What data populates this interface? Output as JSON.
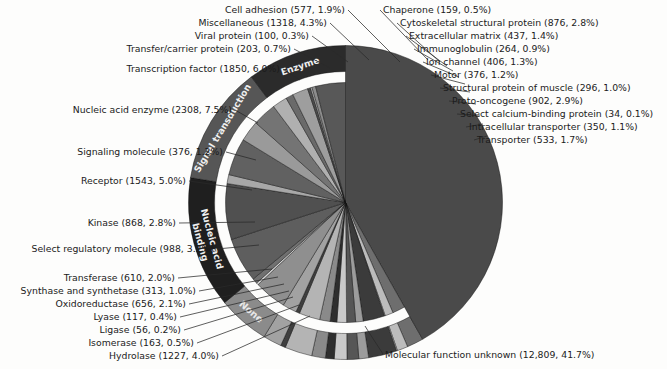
{
  "chart_data": {
    "type": "pie",
    "title": "",
    "subtitle": "",
    "xlabel": "",
    "ylabel": "",
    "legend_position": "none",
    "grid": false,
    "total_count": 30728,
    "value_unit": "proteins",
    "label_format": "name (count, percent)",
    "rings": [
      "inner: individual molecular function categories",
      "outer: grouped super-categories"
    ],
    "categories": [
      "Molecular function unknown",
      "Nucleic acid enzyme",
      "Transcription factor",
      "Transfer/carrier protein",
      "Viral protein",
      "Miscellaneous",
      "Cell adhesion",
      "Chaperone",
      "Cytoskeletal structural protein",
      "Extracellular matrix",
      "Immunoglobulin",
      "Ion channel",
      "Motor",
      "Structural protein of muscle",
      "Proto-oncogene",
      "Select calcium-binding protein",
      "Intracellular transporter",
      "Transporter",
      "Signaling molecule",
      "Receptor",
      "Kinase",
      "Select regulatory molecule",
      "Transferase",
      "Synthase and synthetase",
      "Oxidoreductase",
      "Lyase",
      "Ligase",
      "Isomerase",
      "Hydrolase"
    ],
    "values": [
      12809,
      2308,
      1850,
      203,
      100,
      1318,
      577,
      159,
      876,
      437,
      264,
      406,
      376,
      296,
      902,
      34,
      350,
      533,
      376,
      1543,
      868,
      988,
      610,
      313,
      656,
      117,
      56,
      163,
      1227
    ],
    "percents": [
      41.7,
      7.5,
      6.0,
      0.7,
      0.3,
      4.3,
      1.9,
      0.5,
      2.8,
      1.4,
      0.9,
      1.3,
      1.2,
      1.0,
      2.9,
      0.1,
      1.1,
      1.7,
      1.2,
      5.0,
      2.8,
      3.2,
      2.0,
      1.0,
      2.1,
      0.4,
      0.2,
      0.5,
      4.0
    ]
  },
  "slices": [
    {
      "name": "Molecular function unknown",
      "count": "12,809",
      "percent": "41.7%",
      "label": "Molecular function unknown (12,809, 41.7%)",
      "value": 41.7,
      "shade": "#4a4a4a",
      "group": "none",
      "full_radius": true
    },
    {
      "name": "Transporter",
      "count": "533",
      "percent": "1.7%",
      "label": "Transporter (533, 1.7%)",
      "value": 1.7,
      "shade": "#6e6e6e",
      "group": "ungrouped"
    },
    {
      "name": "Intracellular transporter",
      "count": "350",
      "percent": "1.1%",
      "label": "Intracellular transporter (350, 1.1%)",
      "value": 1.1,
      "shade": "#bcbcbc",
      "group": "ungrouped"
    },
    {
      "name": "Select calcium-binding protein",
      "count": "34",
      "percent": "0.1%",
      "label": "Select calcium-binding protein (34, 0.1%)",
      "value": 0.1,
      "shade": "#d6d6d6",
      "group": "ungrouped"
    },
    {
      "name": "Proto-oncogene",
      "count": "902",
      "percent": "2.9%",
      "label": "Proto-oncogene (902, 2.9%)",
      "value": 2.9,
      "shade": "#3b3b3b",
      "group": "ungrouped"
    },
    {
      "name": "Structural protein of muscle",
      "count": "296",
      "percent": "1.0%",
      "label": "Structural protein of muscle (296, 1.0%)",
      "value": 1.0,
      "shade": "#9c9c9c",
      "group": "ungrouped"
    },
    {
      "name": "Motor",
      "count": "376",
      "percent": "1.2%",
      "label": "Motor (376, 1.2%)",
      "value": 1.2,
      "shade": "#565656",
      "group": "ungrouped"
    },
    {
      "name": "Ion channel",
      "count": "406",
      "percent": "1.3%",
      "label": "Ion channel (406, 1.3%)",
      "value": 1.3,
      "shade": "#c9c9c9",
      "group": "ungrouped"
    },
    {
      "name": "Immunoglobulin",
      "count": "264",
      "percent": "0.9%",
      "label": "Immunoglobulin (264, 0.9%)",
      "value": 0.9,
      "shade": "#2e2e2e",
      "group": "ungrouped"
    },
    {
      "name": "Extracellular matrix",
      "count": "437",
      "percent": "1.4%",
      "label": "Extracellular matrix (437, 1.4%)",
      "value": 1.4,
      "shade": "#8a8a8a",
      "group": "ungrouped"
    },
    {
      "name": "Cytoskeletal structural protein",
      "count": "876",
      "percent": "2.8%",
      "label": "Cytoskeletal structural protein (876, 2.8%)",
      "value": 2.8,
      "shade": "#b4b4b4",
      "group": "ungrouped"
    },
    {
      "name": "Chaperone",
      "count": "159",
      "percent": "0.5%",
      "label": "Chaperone (159, 0.5%)",
      "value": 0.5,
      "shade": "#3f3f3f",
      "group": "ungrouped"
    },
    {
      "name": "Cell adhesion",
      "count": "577",
      "percent": "1.9%",
      "label": "Cell adhesion (577, 1.9%)",
      "value": 1.9,
      "shade": "#a2a2a2",
      "group": "ungrouped"
    },
    {
      "name": "Miscellaneous",
      "count": "1318",
      "percent": "4.3%",
      "label": "Miscellaneous (1318, 4.3%)",
      "value": 4.3,
      "shade": "#8f8f8f",
      "group": "none-group"
    },
    {
      "name": "Viral protein",
      "count": "100",
      "percent": "0.3%",
      "label": "Viral protein (100, 0.3%)",
      "value": 0.3,
      "shade": "#d2d2d2",
      "group": "none-group"
    },
    {
      "name": "Transfer/carrier protein",
      "count": "203",
      "percent": "0.7%",
      "label": "Transfer/carrier protein (203, 0.7%)",
      "value": 0.7,
      "shade": "#707070",
      "group": "none-group"
    },
    {
      "name": "Transcription factor",
      "count": "1850",
      "percent": "6.0%",
      "label": "Transcription factor (1850, 6.0%)",
      "value": 6.0,
      "shade": "#5e5e5e",
      "group": "nucleic"
    },
    {
      "name": "Nucleic acid enzyme",
      "count": "2308",
      "percent": "7.5%",
      "label": "Nucleic acid enzyme (2308, 7.5%)",
      "value": 7.5,
      "shade": "#505050",
      "group": "nucleic"
    },
    {
      "name": "Signaling molecule",
      "count": "376",
      "percent": "1.2%",
      "label": "Signaling molecule (376, 1.2%)",
      "value": 1.2,
      "shade": "#a8a8a8",
      "group": "signal"
    },
    {
      "name": "Receptor",
      "count": "1543",
      "percent": "5.0%",
      "label": "Receptor (1543, 5.0%)",
      "value": 5.0,
      "shade": "#616161",
      "group": "signal"
    },
    {
      "name": "Kinase",
      "count": "868",
      "percent": "2.8%",
      "label": "Kinase (868, 2.8%)",
      "value": 2.8,
      "shade": "#9a9a9a",
      "group": "signal"
    },
    {
      "name": "Select regulatory molecule",
      "count": "988",
      "percent": "3.2%",
      "label": "Select regulatory molecule (988, 3.2%)",
      "value": 3.2,
      "shade": "#747474",
      "group": "signal"
    },
    {
      "name": "Transferase",
      "count": "610",
      "percent": "2.0%",
      "label": "Transferase (610, 2.0%)",
      "value": 2.0,
      "shade": "#b0b0b0",
      "group": "enzyme"
    },
    {
      "name": "Synthase and synthetase",
      "count": "313",
      "percent": "1.0%",
      "label": "Synthase and synthetase (313, 1.0%)",
      "value": 1.0,
      "shade": "#6a6a6a",
      "group": "enzyme"
    },
    {
      "name": "Oxidoreductase",
      "count": "656",
      "percent": "2.1%",
      "label": "Oxidoreductase (656, 2.1%)",
      "value": 2.1,
      "shade": "#9e9e9e",
      "group": "enzyme"
    },
    {
      "name": "Lyase",
      "count": "117",
      "percent": "0.4%",
      "label": "Lyase (117, 0.4%)",
      "value": 0.4,
      "shade": "#4c4c4c",
      "group": "enzyme"
    },
    {
      "name": "Ligase",
      "count": "56",
      "percent": "0.2%",
      "label": "Ligase (56, 0.2%)",
      "value": 0.2,
      "shade": "#c4c4c4",
      "group": "enzyme"
    },
    {
      "name": "Isomerase",
      "count": "163",
      "percent": "0.5%",
      "label": "Isomerase (163, 0.5%)",
      "value": 0.5,
      "shade": "#8c8c8c",
      "group": "enzyme"
    },
    {
      "name": "Hydrolase",
      "count": "1227",
      "percent": "4.0%",
      "label": "Hydrolase (1227, 4.0%)",
      "value": 4.0,
      "shade": "#585858",
      "group": "enzyme"
    }
  ],
  "ring_groups": [
    {
      "name": "None",
      "label": "None",
      "shade": "#8b8b8b"
    },
    {
      "name": "Nucleic acid binding",
      "label": "Nucleic acid binding",
      "line1": "Nucleic acid",
      "line2": "binding",
      "shade": "#1f1f1f"
    },
    {
      "name": "Signal transduction",
      "label": "Signal transduction",
      "shade": "#565656"
    },
    {
      "name": "Enzyme",
      "label": "Enzyme",
      "shade": "#2b2b2b"
    }
  ],
  "labels": {
    "left": [
      "Transcription factor (1850, 6.0%)",
      "Nucleic acid enzyme (2308, 7.5%)",
      "Signaling molecule (376, 1.2%)",
      "Receptor (1543, 5.0%)",
      "Kinase (868, 2.8%)",
      "Select regulatory molecule (988, 3.2%)",
      "Transferase (610, 2.0%)",
      "Synthase and synthetase (313, 1.0%)",
      "Oxidoreductase (656, 2.1%)",
      "Lyase (117, 0.4%)",
      "Ligase (56, 0.2%)",
      "Isomerase (163, 0.5%)",
      "Hydrolase (1227, 4.0%)"
    ],
    "top": [
      "Cell adhesion (577, 1.9%)",
      "Miscellaneous (1318, 4.3%)",
      "Viral protein (100, 0.3%)",
      "Transfer/carrier protein (203, 0.7%)"
    ],
    "right": [
      "Chaperone (159, 0.5%)",
      "Cytoskeletal structural protein (876, 2.8%)",
      "Extracellular matrix (437, 1.4%)",
      "Immunoglobulin (264, 0.9%)",
      "Ion channel (406, 1.3%)",
      "Motor (376, 1.2%)",
      "Structural protein of muscle (296, 1.0%)",
      "Proto-oncogene (902, 2.9%)",
      "Select calcium-binding protein (34, 0.1%)",
      "Intracellular transporter (350, 1.1%)",
      "Transporter (533, 1.7%)"
    ],
    "bottom": [
      "Molecular function unknown (12,809, 41.7%)"
    ]
  }
}
